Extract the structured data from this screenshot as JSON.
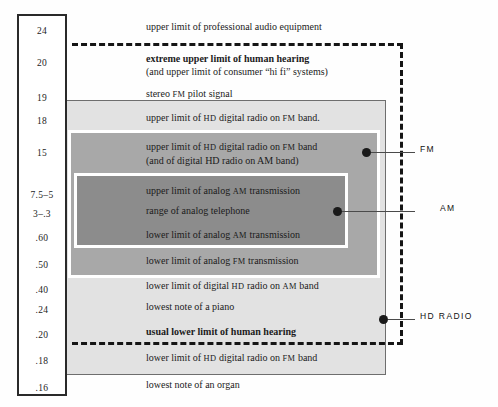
{
  "figure": {
    "colors": {
      "band_outer": "#e2e2e2",
      "band_mid": "#a8a8a8",
      "band_inner": "#8c8c8c",
      "dash": "#151515",
      "text": "#1b1b1b"
    }
  },
  "scale": {
    "name": "frequency-scale",
    "ticks": [
      {
        "value": "24",
        "top": 24
      },
      {
        "value": "20",
        "top": 56
      },
      {
        "value": "19",
        "top": 91
      },
      {
        "value": "18",
        "top": 114
      },
      {
        "value": "15",
        "top": 146
      },
      {
        "value": "7.5–5",
        "top": 188
      },
      {
        "value": "3–.3",
        "top": 207
      },
      {
        "value": ".60",
        "top": 231
      },
      {
        "value": ".50",
        "top": 258
      },
      {
        "value": ".40",
        "top": 283
      },
      {
        "value": ".24",
        "top": 303
      },
      {
        "value": ".20",
        "top": 328
      },
      {
        "value": ".18",
        "top": 354
      },
      {
        "value": ".16",
        "top": 381
      }
    ]
  },
  "rows": [
    {
      "id": "pro-audio",
      "top": 21,
      "bold": false,
      "parts": [
        {
          "t": "upper limit of professional audio equipment",
          "sc": false
        }
      ],
      "sub": null
    },
    {
      "id": "extreme-upper-human-hearing",
      "top": 53,
      "bold": true,
      "parts": [
        {
          "t": "extreme upper limit of human hearing",
          "sc": false
        }
      ],
      "sub": "(and upper limit of consumer “hi fi” systems)"
    },
    {
      "id": "stereo-fm-pilot",
      "top": 88,
      "bold": false,
      "parts": [
        {
          "t": "stereo ",
          "sc": false
        },
        {
          "t": "FM",
          "sc": true
        },
        {
          "t": " pilot signal",
          "sc": false
        }
      ],
      "sub": null
    },
    {
      "id": "upper-hd-fm-band",
      "top": 112,
      "bold": false,
      "parts": [
        {
          "t": "upper limit of ",
          "sc": false
        },
        {
          "t": "HD",
          "sc": true
        },
        {
          "t": " digital radio on ",
          "sc": false
        },
        {
          "t": "FM",
          "sc": true
        },
        {
          "t": " band.",
          "sc": false
        }
      ],
      "sub": null
    },
    {
      "id": "upper-hd-fm-band-2",
      "top": 141,
      "bold": false,
      "parts": [
        {
          "t": "upper limit of ",
          "sc": false
        },
        {
          "t": "HD",
          "sc": true
        },
        {
          "t": " digital radio on ",
          "sc": false
        },
        {
          "t": "FM",
          "sc": true
        },
        {
          "t": " band",
          "sc": false
        }
      ],
      "sub": "(and of digital HD radio on AM band)"
    },
    {
      "id": "upper-analog-am",
      "top": 185,
      "bold": false,
      "parts": [
        {
          "t": "upper limit of analog ",
          "sc": false
        },
        {
          "t": "AM",
          "sc": true
        },
        {
          "t": " transmission",
          "sc": false
        }
      ],
      "sub": null
    },
    {
      "id": "range-analog-telephone",
      "top": 205,
      "bold": false,
      "parts": [
        {
          "t": "range of analog telephone",
          "sc": false
        }
      ],
      "sub": null
    },
    {
      "id": "lower-analog-am",
      "top": 229,
      "bold": false,
      "parts": [
        {
          "t": "lower limit of analog ",
          "sc": false
        },
        {
          "t": "AM",
          "sc": true
        },
        {
          "t": " transmission",
          "sc": false
        }
      ],
      "sub": null
    },
    {
      "id": "lower-analog-fm",
      "top": 255,
      "bold": false,
      "parts": [
        {
          "t": "lower limit of analog ",
          "sc": false
        },
        {
          "t": "FM",
          "sc": true
        },
        {
          "t": " transmission",
          "sc": false
        }
      ],
      "sub": null
    },
    {
      "id": "lower-digital-hd-am",
      "top": 280,
      "bold": false,
      "parts": [
        {
          "t": "lower limit of digital ",
          "sc": false
        },
        {
          "t": "HD",
          "sc": true
        },
        {
          "t": " radio on ",
          "sc": false
        },
        {
          "t": "AM",
          "sc": true
        },
        {
          "t": " band",
          "sc": false
        }
      ],
      "sub": null
    },
    {
      "id": "lowest-note-piano",
      "top": 301,
      "bold": false,
      "parts": [
        {
          "t": "lowest note of a piano",
          "sc": false
        }
      ],
      "sub": null
    },
    {
      "id": "usual-lower-human-hearing",
      "top": 326,
      "bold": true,
      "parts": [
        {
          "t": "usual lower limit of human hearing",
          "sc": false
        }
      ],
      "sub": null
    },
    {
      "id": "lower-hd-fm-band",
      "top": 352,
      "bold": false,
      "parts": [
        {
          "t": "lower limit of ",
          "sc": false
        },
        {
          "t": "HD",
          "sc": true
        },
        {
          "t": " digital radio on ",
          "sc": false
        },
        {
          "t": "FM",
          "sc": true
        },
        {
          "t": " band",
          "sc": false
        }
      ],
      "sub": null
    },
    {
      "id": "lowest-note-organ",
      "top": 379,
      "bold": false,
      "parts": [
        {
          "t": "lowest note of an organ",
          "sc": false
        }
      ],
      "sub": null
    }
  ],
  "callouts": [
    {
      "id": "fm",
      "label": "FM",
      "dot_x": 362,
      "dot_y": 148,
      "line_x": 371,
      "line_w": 44,
      "text_x": 420,
      "text_y": 144
    },
    {
      "id": "am",
      "label": "AM",
      "dot_x": 333,
      "dot_y": 207,
      "line_x": 342,
      "line_w": 73,
      "text_x": 440,
      "text_y": 203
    },
    {
      "id": "hd-radio",
      "label": "HD RADIO",
      "dot_x": 379,
      "dot_y": 315,
      "line_x": 388,
      "line_w": 27,
      "text_x": 420,
      "text_y": 311
    }
  ],
  "chart_data": {
    "type": "table",
    "xlabel": "",
    "ylabel": "frequency (kHz)",
    "grid": false,
    "legend_position": "right",
    "categories": [
      "upper limit of professional audio equipment",
      "extreme upper limit of human hearing",
      "stereo FM pilot signal",
      "upper limit of HD digital radio on FM band.",
      "upper limit of HD digital radio on FM band",
      "upper limit of analog AM transmission",
      "range of analog telephone",
      "lower limit of analog AM transmission",
      "lower limit of analog FM transmission",
      "lower limit of digital HD radio on AM band",
      "lowest note of a piano",
      "usual lower limit of human hearing",
      "lower limit of HD digital radio on FM band",
      "lowest note of an organ"
    ],
    "values": [
      "24",
      "20",
      "19",
      "18",
      "15",
      "7.5–5",
      "3–.3",
      ".60",
      ".50",
      ".40",
      ".24",
      ".20",
      ".18",
      ".16"
    ],
    "series": [
      {
        "name": "FM",
        "range": [
          "19",
          ".18"
        ]
      },
      {
        "name": "AM",
        "range": [
          "15",
          ".40"
        ]
      },
      {
        "name": "HD RADIO",
        "range": [
          "19",
          ".18"
        ]
      },
      {
        "name": "human hearing (dashed envelope)",
        "range": [
          "20",
          ".20"
        ]
      }
    ]
  }
}
